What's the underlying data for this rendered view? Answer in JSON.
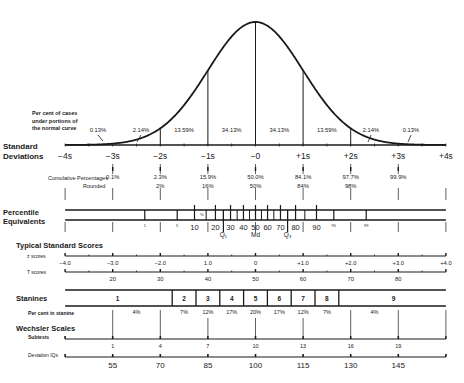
{
  "chart_data": {
    "type": "normal-distribution-diagram",
    "title": "",
    "curve": {
      "label_lines": [
        "Per cent of cases",
        "under portions of",
        "the normal curve"
      ],
      "segments": [
        {
          "from": -4,
          "to": -3,
          "label": "0.13%"
        },
        {
          "from": -3,
          "to": -2,
          "label": "2.14%"
        },
        {
          "from": -2,
          "to": -1,
          "label": "13.59%"
        },
        {
          "from": -1,
          "to": 0,
          "label": "34.13%"
        },
        {
          "from": 0,
          "to": 1,
          "label": "34.13%"
        },
        {
          "from": 1,
          "to": 2,
          "label": "13.59%"
        },
        {
          "from": 2,
          "to": 3,
          "label": "2.14%"
        },
        {
          "from": 3,
          "to": 4,
          "label": "0.13%"
        }
      ],
      "vertical_lines_at": [
        -2,
        -1,
        0,
        1,
        2
      ]
    },
    "standard_deviations": {
      "label_lines": [
        "Standard",
        "Deviations"
      ],
      "ticks": [
        {
          "s": -4,
          "label": "−4s"
        },
        {
          "s": -3,
          "label": "−3s"
        },
        {
          "s": -2,
          "label": "−2s"
        },
        {
          "s": -1,
          "label": "−1s"
        },
        {
          "s": 0,
          "label": "−0"
        },
        {
          "s": 1,
          "label": "+1s"
        },
        {
          "s": 2,
          "label": "+2s"
        },
        {
          "s": 3,
          "label": "+3s"
        },
        {
          "s": 4,
          "label": "+4s"
        }
      ]
    },
    "cumulative_percentages": {
      "label": "Cumulative Percentages",
      "rounded_label": "Rounded",
      "values": [
        {
          "s": -3,
          "value": "0.1%",
          "rounded": ""
        },
        {
          "s": -2,
          "value": "2.3%",
          "rounded": "2%"
        },
        {
          "s": -1,
          "value": "15.9%",
          "rounded": "16%"
        },
        {
          "s": 0,
          "value": "50.0%",
          "rounded": "50%"
        },
        {
          "s": 1,
          "value": "84.1%",
          "rounded": "84%"
        },
        {
          "s": 2,
          "value": "97.7%",
          "rounded": "98%"
        },
        {
          "s": 3,
          "value": "99.9%",
          "rounded": ""
        }
      ]
    },
    "percentile_equivalents": {
      "label_lines": [
        "Percentile",
        "Equivalents"
      ],
      "ticks": [
        {
          "p": 1,
          "label": "1",
          "small": true
        },
        {
          "p": 5,
          "label": "5",
          "small": true
        },
        {
          "p": 10,
          "label": "10"
        },
        {
          "p": 20,
          "label": "20"
        },
        {
          "p": 30,
          "label": "30"
        },
        {
          "p": 40,
          "label": "40"
        },
        {
          "p": 50,
          "label": "50"
        },
        {
          "p": 60,
          "label": "60"
        },
        {
          "p": 70,
          "label": "70"
        },
        {
          "p": 80,
          "label": "80"
        },
        {
          "p": 90,
          "label": "90"
        },
        {
          "p": 95,
          "label": "95",
          "small": true
        },
        {
          "p": 99,
          "label": "99",
          "small": true
        }
      ],
      "minor_ticks": [
        15,
        25,
        35,
        45,
        55,
        65,
        75,
        85
      ],
      "quartiles": [
        {
          "p": 25,
          "label": "Q₁"
        },
        {
          "p": 50,
          "label": "Md"
        },
        {
          "p": 75,
          "label": "Q₃"
        }
      ],
      "inner_mark": "%"
    },
    "typical_standard_scores": {
      "label": "Typical Standard Scores",
      "z_scores": {
        "label": "z scores",
        "ticks": [
          {
            "s": -4,
            "label": "−4.0"
          },
          {
            "s": -3,
            "label": "−3.0"
          },
          {
            "s": -2,
            "label": "−2.0"
          },
          {
            "s": -1,
            "label": "1.0"
          },
          {
            "s": 0,
            "label": "0"
          },
          {
            "s": 1,
            "label": "+1.0"
          },
          {
            "s": 2,
            "label": "+2.0"
          },
          {
            "s": 3,
            "label": "+3.0"
          },
          {
            "s": 4,
            "label": "+4.0"
          }
        ]
      },
      "t_scores": {
        "label": "T scores",
        "ticks": [
          {
            "s": -3,
            "label": "20"
          },
          {
            "s": -2,
            "label": "30"
          },
          {
            "s": -1,
            "label": "40"
          },
          {
            "s": 0,
            "label": "50"
          },
          {
            "s": 1,
            "label": "60"
          },
          {
            "s": 2,
            "label": "70"
          },
          {
            "s": 3,
            "label": "80"
          }
        ]
      }
    },
    "stanines": {
      "label": "Stanines",
      "boxes": [
        {
          "label": "1",
          "from": -4,
          "to": -1.75,
          "percent": "4%"
        },
        {
          "label": "2",
          "from": -1.75,
          "to": -1.25,
          "percent": "7%"
        },
        {
          "label": "3",
          "from": -1.25,
          "to": -0.75,
          "percent": "12%"
        },
        {
          "label": "4",
          "from": -0.75,
          "to": -0.25,
          "percent": "17%"
        },
        {
          "label": "5",
          "from": -0.25,
          "to": 0.25,
          "percent": "20%"
        },
        {
          "label": "6",
          "from": 0.25,
          "to": 0.75,
          "percent": "17%"
        },
        {
          "label": "7",
          "from": 0.75,
          "to": 1.25,
          "percent": "12%"
        },
        {
          "label": "8",
          "from": 1.25,
          "to": 1.75,
          "percent": "7%"
        },
        {
          "label": "9",
          "from": 1.75,
          "to": 4,
          "percent": "4%"
        }
      ],
      "percent_label": "Per cent in stanine"
    },
    "wechsler_scales": {
      "label": "Wechsler Scales",
      "subtests": {
        "label": "Subtests",
        "ticks": [
          {
            "s": -3,
            "label": "1"
          },
          {
            "s": -2,
            "label": "4"
          },
          {
            "s": -1,
            "label": "7"
          },
          {
            "s": 0,
            "label": "10"
          },
          {
            "s": 1,
            "label": "13"
          },
          {
            "s": 2,
            "label": "16"
          },
          {
            "s": 3,
            "label": "19"
          }
        ]
      },
      "deviation_iq": {
        "label": "Deviation IQs",
        "ticks": [
          {
            "s": -3,
            "label": "55"
          },
          {
            "s": -2,
            "label": "70"
          },
          {
            "s": -1,
            "label": "85"
          },
          {
            "s": 0,
            "label": "100"
          },
          {
            "s": 1,
            "label": "115"
          },
          {
            "s": 2,
            "label": "130"
          },
          {
            "s": 3,
            "label": "145"
          }
        ]
      }
    }
  }
}
